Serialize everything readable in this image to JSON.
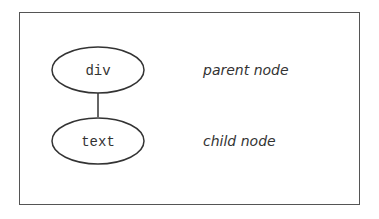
{
  "diagram": {
    "nodes": [
      {
        "id": "parent",
        "text": "div",
        "caption": "parent node"
      },
      {
        "id": "child",
        "text": "text",
        "caption": "child node"
      }
    ],
    "edges": [
      {
        "from": "parent",
        "to": "child"
      }
    ]
  }
}
